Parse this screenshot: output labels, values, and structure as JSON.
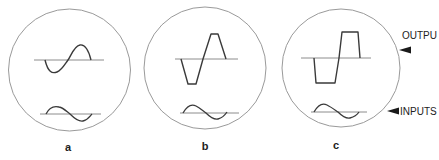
{
  "figure": {
    "colors": {
      "background": "#ffffff",
      "circle_stroke": "#9a9a9a",
      "baseline_stroke": "#8c8c8c",
      "waveform_stroke": "#3a3a3a",
      "text": "#222222",
      "arrow": "#1a1a1a"
    },
    "panels": [
      {
        "label": "a",
        "output_shape": "sine",
        "input_shape": "sine"
      },
      {
        "label": "b",
        "output_shape": "clipped-trapezoid",
        "input_shape": "sine"
      },
      {
        "label": "c",
        "output_shape": "square-like",
        "input_shape": "sine"
      }
    ],
    "annotations": {
      "output_label": "OUTPU",
      "input_label": "INPUTS",
      "output_arrow": "left-pointing-triangle-arrow",
      "input_arrow": "left-pointing-triangle-arrow"
    }
  }
}
